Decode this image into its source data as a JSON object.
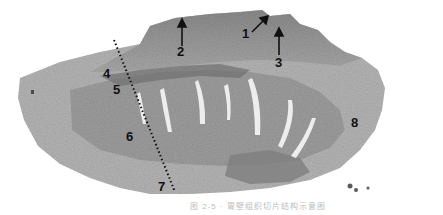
{
  "figure": {
    "type": "histology-micrograph",
    "colors": {
      "tissue_dark": "#6f6f6f",
      "tissue_mid": "#9a9a9a",
      "tissue_light": "#c8c8c8",
      "background": "#ffffff",
      "label": "#111111"
    },
    "labels": [
      {
        "id": "1",
        "text": "1",
        "x": 242,
        "y": 33
      },
      {
        "id": "2",
        "text": "2",
        "x": 177,
        "y": 49
      },
      {
        "id": "3",
        "text": "3",
        "x": 275,
        "y": 56
      },
      {
        "id": "4",
        "text": "4",
        "x": 104,
        "y": 69
      },
      {
        "id": "5",
        "text": "5",
        "x": 113,
        "y": 86
      },
      {
        "id": "6",
        "text": "6",
        "x": 126,
        "y": 130
      },
      {
        "id": "7",
        "text": "7",
        "x": 158,
        "y": 180
      },
      {
        "id": "8",
        "text": "8",
        "x": 351,
        "y": 116
      }
    ],
    "arrows": [
      {
        "name": "arrow-2",
        "x1": 182,
        "y1": 46,
        "x2": 182,
        "y2": 21
      },
      {
        "name": "arrow-1",
        "x1": 252,
        "y1": 32,
        "x2": 268,
        "y2": 16
      },
      {
        "name": "arrow-3",
        "x1": 279,
        "y1": 55,
        "x2": 279,
        "y2": 30
      }
    ],
    "dotted_line": {
      "x1": 114,
      "y1": 40,
      "x2": 175,
      "y2": 192
    },
    "caption": "图 2-5 · 胃壁组织切片结构示意图"
  }
}
